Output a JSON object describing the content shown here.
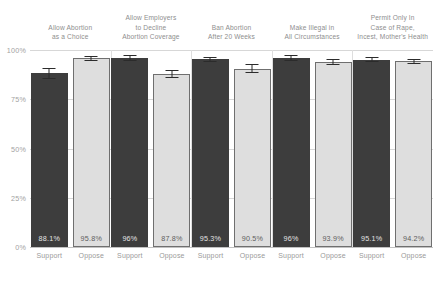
{
  "chart_data": {
    "type": "bar",
    "title": "",
    "subtitle": "",
    "xlabel": "",
    "ylabel": "",
    "ylim": [
      0,
      100
    ],
    "grid": true,
    "legend_position": "none",
    "y_ticks": [
      "100%",
      "75%",
      "50%",
      "25%",
      "0%"
    ],
    "y_tick_values": [
      100,
      75,
      50,
      25,
      0
    ],
    "categories": [
      "Support",
      "Oppose"
    ],
    "facets": [
      {
        "title_lines": [
          "Allow Abortion",
          "as a Choice"
        ],
        "bars": [
          {
            "category": "Support",
            "value": 88.1,
            "label": "88.1%",
            "error": 3.0,
            "style": "support"
          },
          {
            "category": "Oppose",
            "value": 95.8,
            "label": "95.8%",
            "error": 1.2,
            "style": "oppose"
          }
        ]
      },
      {
        "title_lines": [
          "Allow Employers",
          "to Decline",
          "Abortion Coverage"
        ],
        "bars": [
          {
            "category": "Support",
            "value": 96.0,
            "label": "96%",
            "error": 1.4,
            "style": "support"
          },
          {
            "category": "Oppose",
            "value": 87.8,
            "label": "87.8%",
            "error": 2.0,
            "style": "oppose"
          }
        ]
      },
      {
        "title_lines": [
          "Ban Abortion",
          "After 20 Weeks"
        ],
        "bars": [
          {
            "category": "Support",
            "value": 95.3,
            "label": "95.3%",
            "error": 1.3,
            "style": "support"
          },
          {
            "category": "Oppose",
            "value": 90.5,
            "label": "90.5%",
            "error": 2.4,
            "style": "oppose"
          }
        ]
      },
      {
        "title_lines": [
          "Make Illegal in",
          "All Circumstances"
        ],
        "bars": [
          {
            "category": "Support",
            "value": 96.0,
            "label": "96%",
            "error": 1.4,
            "style": "support"
          },
          {
            "category": "Oppose",
            "value": 93.9,
            "label": "93.9%",
            "error": 1.3,
            "style": "oppose"
          }
        ]
      },
      {
        "title_lines": [
          "Permit Only In",
          "Case of Rape,",
          "Incest, Mother's Health"
        ],
        "bars": [
          {
            "category": "Support",
            "value": 95.1,
            "label": "95.1%",
            "error": 1.4,
            "style": "support"
          },
          {
            "category": "Oppose",
            "value": 94.2,
            "label": "94.2%",
            "error": 1.2,
            "style": "oppose"
          }
        ]
      }
    ]
  },
  "colors": {
    "support_bar": "#3d3d3d",
    "oppose_bar": "#dedede",
    "oppose_border": "#6f6f6f",
    "gridline": "#d7d7d7",
    "text": "#8e8e8e",
    "background": "#ffffff"
  }
}
